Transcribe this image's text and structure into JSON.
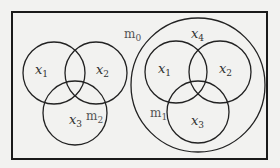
{
  "diagram": {
    "frame": {
      "x": 12,
      "y": 12,
      "width": 255,
      "height": 147,
      "stroke": "#1a1a1a"
    },
    "outer_label": {
      "base": "m",
      "sub": "0"
    },
    "left_venn": {
      "label": {
        "base": "m",
        "sub": "2"
      },
      "circles": [
        {
          "name": "x1",
          "cx": 54,
          "cy": 73,
          "r": 31,
          "label": {
            "base": "x",
            "sub": "1"
          }
        },
        {
          "name": "x2",
          "cx": 96,
          "cy": 73,
          "r": 31,
          "label": {
            "base": "x",
            "sub": "2"
          }
        },
        {
          "name": "x3",
          "cx": 75,
          "cy": 113,
          "r": 32,
          "label": {
            "base": "x",
            "sub": "3"
          }
        }
      ]
    },
    "right_venn": {
      "label": {
        "base": "m",
        "sub": "1"
      },
      "enclosing": {
        "name": "x4",
        "cx": 198,
        "cy": 85,
        "r": 67,
        "label": {
          "base": "x",
          "sub": "4"
        }
      },
      "circles": [
        {
          "name": "x1",
          "cx": 176,
          "cy": 72,
          "r": 31,
          "label": {
            "base": "x",
            "sub": "1"
          }
        },
        {
          "name": "x2",
          "cx": 220,
          "cy": 72,
          "r": 31,
          "label": {
            "base": "x",
            "sub": "2"
          }
        },
        {
          "name": "x3",
          "cx": 198,
          "cy": 112,
          "r": 31,
          "label": {
            "base": "x",
            "sub": "3"
          }
        }
      ]
    }
  }
}
